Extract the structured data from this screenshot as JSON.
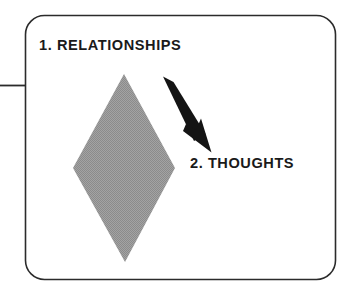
{
  "figure": {
    "type": "process-diagram",
    "background_color": "#ffffff",
    "frame": {
      "shape": "rounded-rectangle",
      "border_color": "#2b2b2b",
      "fill_color": "#ffffff",
      "corner_radius": 20
    },
    "connector_line": {
      "name": "left-leader-line",
      "orientation": "horizontal",
      "color": "#2b2b2b"
    },
    "shapes": [
      {
        "name": "diamond",
        "type": "rhombus",
        "fill_color": "#989898",
        "outline": "none"
      },
      {
        "name": "arrow",
        "type": "arrow",
        "direction": "down-right",
        "color": "#141414"
      }
    ],
    "labels": [
      {
        "id": "step1",
        "number": "1.",
        "text": "1. RELATIONSHIPS",
        "color": "#1a1a1a",
        "style": "bold-uppercase"
      },
      {
        "id": "step2",
        "number": "2.",
        "text": "2. THOUGHTS",
        "color": "#1a1a1a",
        "style": "bold-uppercase"
      }
    ]
  }
}
